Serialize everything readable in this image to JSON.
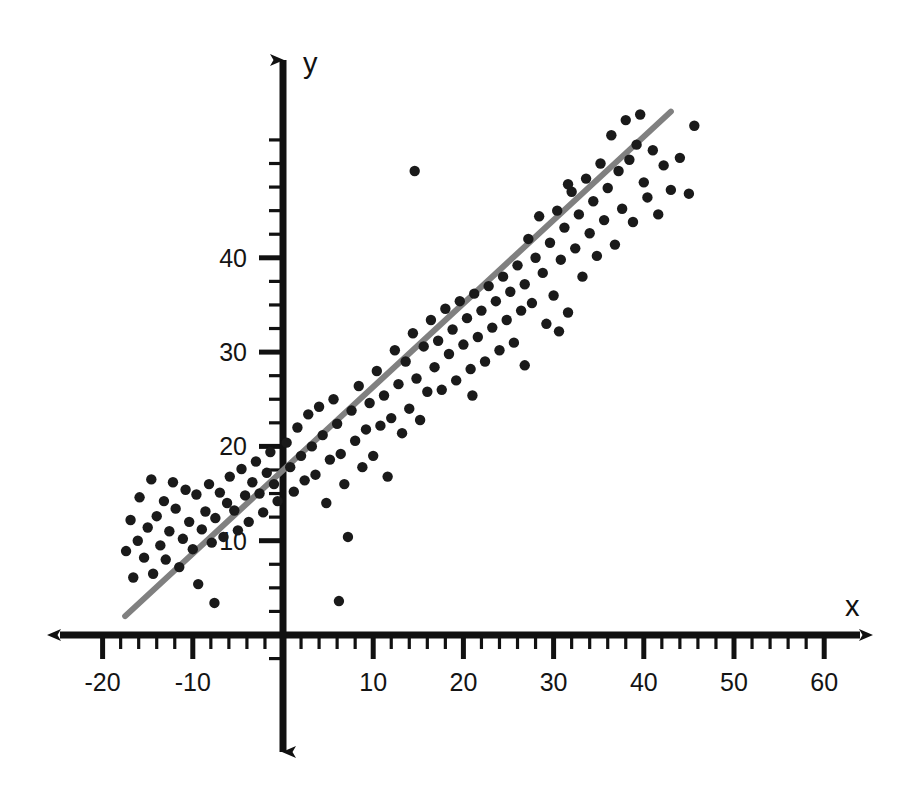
{
  "figure": {
    "background_color": "#ffffff",
    "width": 920,
    "height": 797
  },
  "axes": {
    "x_axis_label": "x",
    "y_axis_label": "y",
    "axis_color": "#111111",
    "origin_px": [
      283,
      635
    ],
    "x_scale_px_per_unit": 9.02,
    "y_scale_px_per_unit": 9.43,
    "x_tick_labels": [
      "-20",
      "-10",
      "10",
      "20",
      "30",
      "40",
      "50",
      "60"
    ],
    "x_tick_values": [
      -20,
      -10,
      10,
      20,
      30,
      40,
      50,
      60
    ],
    "y_tick_labels": [
      "10",
      "20",
      "30",
      "40"
    ],
    "y_tick_values": [
      10,
      20,
      30,
      40
    ],
    "x_minor_tick_step": 2,
    "y_minor_tick_step": 2.5,
    "x_arrow_left_px": 48,
    "x_arrow_right_px": 872,
    "y_arrow_top_px": 47,
    "y_arrow_bottom_px": 765
  },
  "chart_data": {
    "type": "scatter",
    "title": "",
    "subtitle": "",
    "xlabel": "x",
    "ylabel": "y",
    "xlim": [
      -22,
      62
    ],
    "ylim": [
      -2,
      58
    ],
    "grid": false,
    "legend": false,
    "point_color": "#1a1a1a",
    "point_radius_px": 5.2,
    "series": [
      {
        "name": "observations",
        "marker": "circle",
        "points": [
          [
            -17.4,
            8.9
          ],
          [
            -16.9,
            12.2
          ],
          [
            -16.6,
            6.1
          ],
          [
            -16.1,
            10.0
          ],
          [
            -15.9,
            14.6
          ],
          [
            -15.4,
            8.2
          ],
          [
            -15.0,
            11.4
          ],
          [
            -14.6,
            16.5
          ],
          [
            -14.4,
            6.5
          ],
          [
            -14.0,
            12.6
          ],
          [
            -13.6,
            9.5
          ],
          [
            -13.2,
            14.2
          ],
          [
            -13.0,
            8.0
          ],
          [
            -12.6,
            11.0
          ],
          [
            -12.2,
            16.2
          ],
          [
            -11.9,
            13.4
          ],
          [
            -11.5,
            7.2
          ],
          [
            -11.1,
            10.2
          ],
          [
            -10.8,
            15.4
          ],
          [
            -10.4,
            12.0
          ],
          [
            -10.0,
            9.1
          ],
          [
            -9.6,
            14.9
          ],
          [
            -9.4,
            5.4
          ],
          [
            -9.0,
            11.2
          ],
          [
            -8.6,
            13.1
          ],
          [
            -8.2,
            16.0
          ],
          [
            -7.9,
            9.8
          ],
          [
            -7.5,
            12.4
          ],
          [
            -7.0,
            15.1
          ],
          [
            -6.6,
            10.4
          ],
          [
            -6.2,
            14.0
          ],
          [
            -5.9,
            16.8
          ],
          [
            -5.4,
            13.2
          ],
          [
            -5.0,
            11.1
          ],
          [
            -4.6,
            17.6
          ],
          [
            -4.2,
            14.8
          ],
          [
            -3.8,
            12.0
          ],
          [
            -3.4,
            16.2
          ],
          [
            -3.0,
            18.4
          ],
          [
            -2.6,
            15.0
          ],
          [
            -2.2,
            13.0
          ],
          [
            -1.8,
            17.2
          ],
          [
            -1.4,
            19.4
          ],
          [
            -1.0,
            16.0
          ],
          [
            -0.6,
            14.2
          ],
          [
            0.4,
            20.4
          ],
          [
            0.8,
            17.8
          ],
          [
            1.2,
            15.2
          ],
          [
            1.6,
            22.0
          ],
          [
            2.0,
            19.0
          ],
          [
            2.4,
            16.4
          ],
          [
            2.8,
            23.4
          ],
          [
            3.2,
            20.0
          ],
          [
            3.6,
            17.0
          ],
          [
            4.0,
            24.2
          ],
          [
            4.4,
            21.2
          ],
          [
            4.8,
            14.0
          ],
          [
            5.2,
            18.6
          ],
          [
            5.6,
            25.0
          ],
          [
            6.0,
            22.4
          ],
          [
            6.4,
            19.2
          ],
          [
            6.8,
            16.0
          ],
          [
            7.2,
            10.4
          ],
          [
            7.6,
            23.8
          ],
          [
            8.0,
            20.6
          ],
          [
            8.4,
            26.4
          ],
          [
            8.8,
            17.8
          ],
          [
            9.2,
            21.8
          ],
          [
            9.6,
            24.6
          ],
          [
            10.0,
            19.0
          ],
          [
            10.4,
            28.0
          ],
          [
            10.8,
            22.2
          ],
          [
            11.2,
            25.4
          ],
          [
            11.6,
            16.8
          ],
          [
            12.0,
            23.0
          ],
          [
            12.4,
            30.2
          ],
          [
            12.8,
            26.6
          ],
          [
            13.2,
            21.4
          ],
          [
            13.6,
            29.0
          ],
          [
            14.0,
            24.0
          ],
          [
            14.4,
            32.0
          ],
          [
            14.8,
            27.2
          ],
          [
            15.2,
            22.8
          ],
          [
            15.6,
            30.6
          ],
          [
            16.0,
            25.8
          ],
          [
            16.4,
            33.4
          ],
          [
            16.8,
            28.4
          ],
          [
            17.2,
            31.2
          ],
          [
            17.6,
            26.0
          ],
          [
            18.0,
            34.6
          ],
          [
            18.4,
            29.8
          ],
          [
            18.8,
            32.4
          ],
          [
            19.2,
            27.0
          ],
          [
            19.6,
            35.4
          ],
          [
            20.0,
            30.8
          ],
          [
            20.4,
            33.6
          ],
          [
            20.8,
            28.2
          ],
          [
            21.2,
            36.2
          ],
          [
            21.6,
            31.6
          ],
          [
            22.0,
            34.4
          ],
          [
            22.4,
            29.0
          ],
          [
            22.8,
            37.0
          ],
          [
            23.2,
            32.6
          ],
          [
            23.6,
            35.4
          ],
          [
            24.0,
            30.2
          ],
          [
            24.4,
            38.0
          ],
          [
            24.8,
            33.4
          ],
          [
            25.2,
            36.4
          ],
          [
            25.6,
            31.0
          ],
          [
            26.0,
            39.2
          ],
          [
            26.4,
            34.4
          ],
          [
            26.8,
            37.2
          ],
          [
            27.2,
            42.0
          ],
          [
            27.6,
            35.2
          ],
          [
            28.0,
            40.0
          ],
          [
            28.4,
            44.4
          ],
          [
            28.8,
            38.4
          ],
          [
            29.2,
            33.0
          ],
          [
            29.6,
            41.6
          ],
          [
            30.0,
            36.0
          ],
          [
            30.4,
            45.0
          ],
          [
            30.8,
            39.8
          ],
          [
            31.2,
            43.2
          ],
          [
            31.6,
            34.2
          ],
          [
            32.0,
            47.0
          ],
          [
            32.4,
            41.0
          ],
          [
            32.8,
            44.6
          ],
          [
            33.2,
            38.0
          ],
          [
            33.6,
            48.4
          ],
          [
            34.0,
            42.6
          ],
          [
            34.4,
            46.0
          ],
          [
            34.8,
            40.2
          ],
          [
            35.2,
            50.0
          ],
          [
            35.6,
            44.0
          ],
          [
            36.0,
            47.4
          ],
          [
            36.4,
            53.0
          ],
          [
            36.8,
            41.4
          ],
          [
            37.2,
            49.2
          ],
          [
            37.6,
            45.2
          ],
          [
            38.0,
            54.6
          ],
          [
            38.4,
            50.4
          ],
          [
            38.8,
            43.8
          ],
          [
            39.2,
            52.0
          ],
          [
            39.6,
            55.2
          ],
          [
            40.0,
            48.0
          ],
          [
            40.4,
            46.4
          ],
          [
            41.0,
            51.4
          ],
          [
            41.6,
            44.6
          ],
          [
            42.2,
            49.8
          ],
          [
            43.0,
            47.2
          ],
          [
            44.0,
            50.6
          ],
          [
            45.0,
            46.8
          ],
          [
            45.6,
            54.0
          ],
          [
            14.6,
            49.2
          ],
          [
            21.0,
            25.4
          ],
          [
            26.8,
            28.6
          ],
          [
            30.6,
            32.2
          ],
          [
            6.2,
            3.6
          ],
          [
            31.6,
            47.8
          ],
          [
            -7.6,
            3.4
          ]
        ]
      }
    ],
    "trendline": {
      "name": "least-squares regression line",
      "color": "#808080",
      "width_px": 6,
      "slope": 0.885,
      "intercept": 17.5,
      "x_start": -17.5,
      "x_end": 43.0,
      "y_start": 2.0,
      "y_end": 55.5
    }
  }
}
